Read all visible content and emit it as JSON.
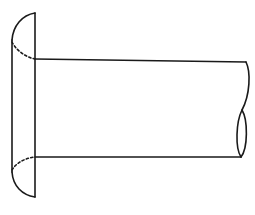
{
  "diagram": {
    "colors": {
      "background": "#ffffff",
      "line": "#1a1a1a"
    },
    "parts": [
      {
        "id": "head",
        "label": "head"
      },
      {
        "id": "shaft",
        "label": "shaft"
      },
      {
        "id": "break",
        "label": "break-line"
      }
    ]
  }
}
